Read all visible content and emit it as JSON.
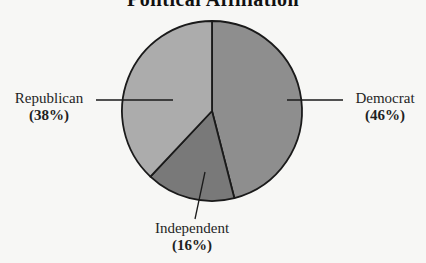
{
  "chart_data": {
    "type": "pie",
    "title": "Political Affiliation",
    "categories": [
      "Democrat",
      "Independent",
      "Republican"
    ],
    "values": [
      46,
      16,
      38
    ],
    "unit": "%",
    "slices": [
      {
        "label": "Democrat",
        "value": 46,
        "display": "(46%)",
        "color": "#8e8e8e"
      },
      {
        "label": "Independent",
        "value": 16,
        "display": "(16%)",
        "color": "#797979"
      },
      {
        "label": "Republican",
        "value": 38,
        "display": "(38%)",
        "color": "#acacac"
      }
    ],
    "start_angle_deg": 0,
    "direction": "clockwise",
    "legend": "none (callout labels with leader lines)"
  },
  "labels": {
    "democrat": {
      "name": "Democrat",
      "pct": "(46%)"
    },
    "independent": {
      "name": "Independent",
      "pct": "(16%)"
    },
    "republican": {
      "name": "Republican",
      "pct": "(38%)"
    }
  }
}
